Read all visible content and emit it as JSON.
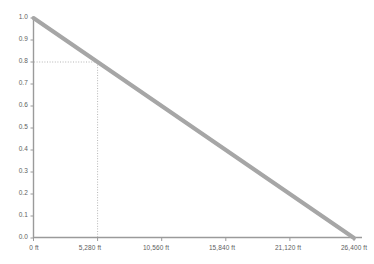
{
  "chart_data": {
    "type": "line",
    "title": "",
    "subtitle": "",
    "xlabel": "",
    "ylabel": "",
    "xlim": [
      0,
      26400
    ],
    "ylim": [
      0,
      1.0
    ],
    "grid": false,
    "legend": "none",
    "x_unit": "ft",
    "x_tick_values": [
      0,
      5280,
      10560,
      15840,
      21120,
      26400
    ],
    "x_tick_labels": [
      "0 ft",
      "5,280 ft",
      "10,560 ft",
      "15,840 ft",
      "21,120 ft",
      "26,400 ft"
    ],
    "y_tick_values": [
      0.0,
      0.1,
      0.2,
      0.3,
      0.4,
      0.5,
      0.6,
      0.7,
      0.8,
      0.9,
      1.0
    ],
    "y_tick_labels": [
      "0.0",
      "0.1",
      "0.2",
      "0.3",
      "0.4",
      "0.5",
      "0.6",
      "0.7",
      "0.8",
      "0.9",
      "1.0"
    ],
    "series": [
      {
        "name": "",
        "x": [
          0,
          5280,
          10560,
          15840,
          21120,
          26400
        ],
        "values": [
          1.0,
          0.8,
          0.6,
          0.4,
          0.2,
          0.0
        ],
        "color": "#a6a6a6",
        "line_width": 4
      }
    ],
    "annotations": [
      {
        "name": "guide-point",
        "x": 5280,
        "y": 0.8,
        "style": "dotted-crosshair",
        "color": "#b5b5b5"
      }
    ],
    "axis_color": "#9a9a9a",
    "tick_label_color": "#5e5e5e",
    "background_color": "#ffffff"
  }
}
